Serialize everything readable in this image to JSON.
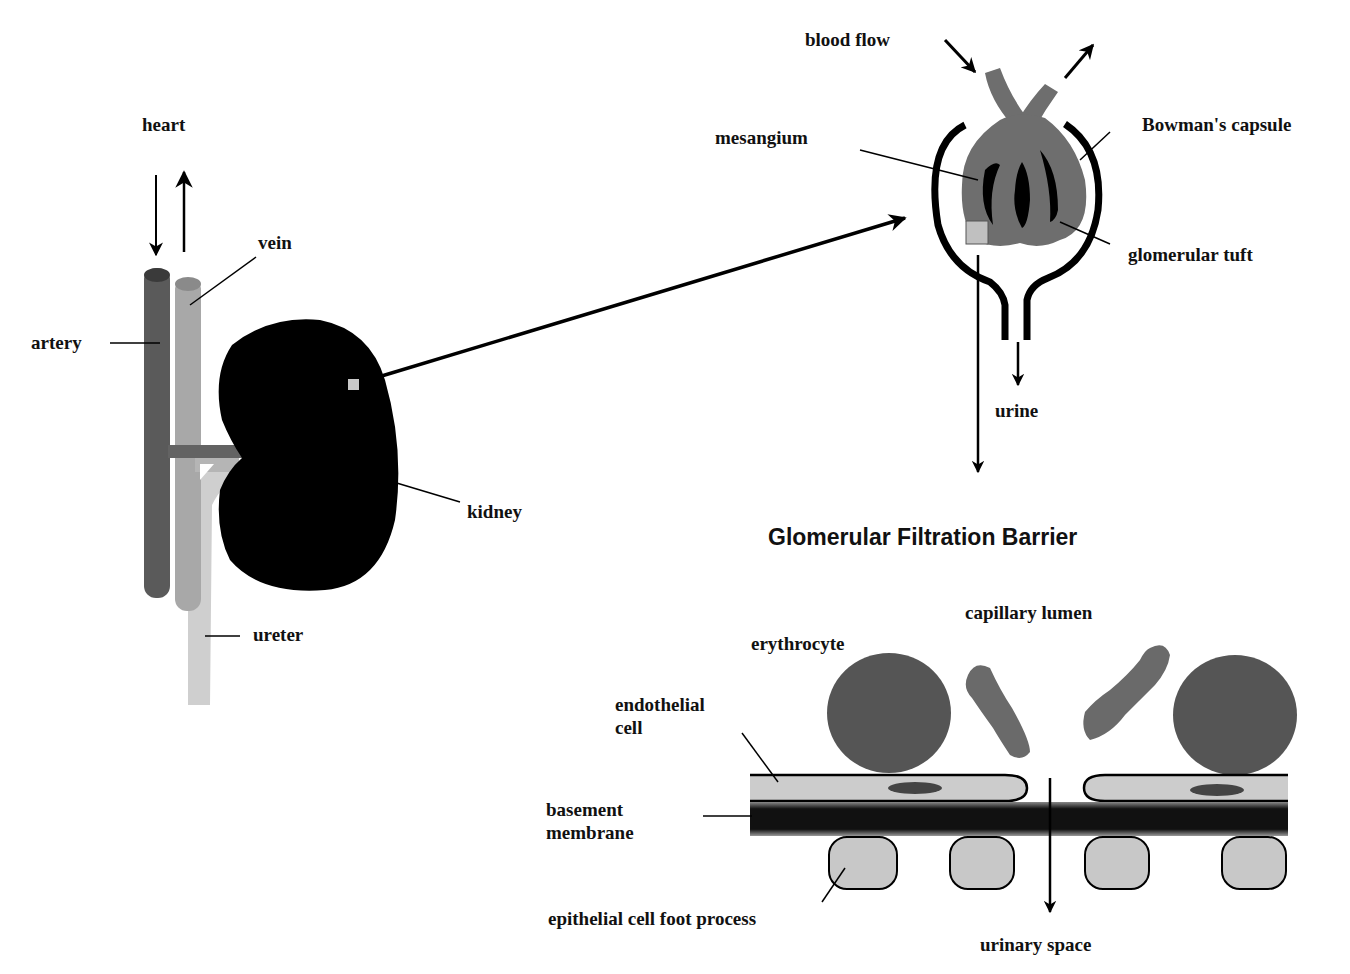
{
  "diagram": {
    "kidney_overview": {
      "labels": {
        "heart": "heart",
        "vein": "vein",
        "artery": "artery",
        "kidney": "kidney",
        "ureter": "ureter"
      }
    },
    "glomerulus": {
      "labels": {
        "blood_flow": "blood flow",
        "mesangium": "mesangium",
        "bowmans_capsule": "Bowman's capsule",
        "glomerular_tuft": "glomerular tuft",
        "urine": "urine"
      }
    },
    "filtration_barrier": {
      "title": "Glomerular Filtration Barrier",
      "labels": {
        "capillary_lumen": "capillary lumen",
        "erythrocyte": "erythrocyte",
        "endothelial_cell_line1": "endothelial",
        "endothelial_cell_line2": "cell",
        "basement_membrane_line1": "basement",
        "basement_membrane_line2": "membrane",
        "epithelial_foot_process": "epithelial cell foot process",
        "urinary_space": "urinary space"
      }
    },
    "colors": {
      "background": "#ffffff",
      "black": "#000000",
      "artery": "#5a5a5a",
      "vein": "#a8a8a8",
      "ureter": "#cfcfcf",
      "tuft": "#6e6e6e",
      "erythrocyte": "#555555",
      "platelet": "#6a6a6a",
      "endothelium": "#cccccc",
      "foot_process": "#c8c8c8"
    }
  }
}
